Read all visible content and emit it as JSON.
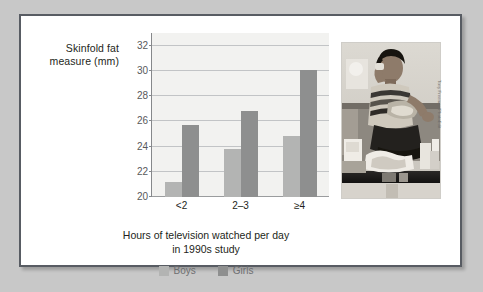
{
  "figure": {
    "background_color": "#c8c8c8",
    "card_color": "#ffffff",
    "frame_color": "#585c63"
  },
  "chart_data": {
    "type": "bar",
    "title": "",
    "subtitle": "",
    "categories": [
      "<2",
      "2–3",
      "≥4"
    ],
    "series": [
      {
        "name": "Boys",
        "color": "#b3b4b3",
        "values": [
          21.2,
          23.8,
          24.8
        ]
      },
      {
        "name": "Girls",
        "color": "#8e8f8f",
        "values": [
          25.7,
          26.8,
          30.1
        ]
      }
    ],
    "xlabel": "Hours of television watched per day in 1990s study",
    "ylabel": "Skinfold fat measure (mm)",
    "ylim": [
      20,
      33
    ],
    "yticks": [
      20,
      22,
      24,
      26,
      28,
      30,
      32
    ],
    "grid": true,
    "legend_position": "bottom-center",
    "plot_background": "#f2f2f0"
  },
  "y_axis": {
    "title_line1": "Skinfold fat",
    "title_line2": "measure (mm)",
    "tick_labels": [
      "32",
      "30",
      "28",
      "26",
      "24",
      "22",
      "20"
    ]
  },
  "x_axis": {
    "tick_labels": [
      "<2",
      "2–3",
      "≥4"
    ],
    "title_line1": "Hours of television watched per day",
    "title_line2": "in 1990s study"
  },
  "legend": {
    "items": [
      {
        "label": "Boys",
        "color": "#b3b4b3"
      },
      {
        "label": "Girls",
        "color": "#8e8f8f"
      }
    ]
  },
  "photo": {
    "alt": "Teenage boy sitting on a couch eating snack foods surrounded by junk food packaging",
    "credit": "Tony Freeman/PhotoEdit"
  }
}
